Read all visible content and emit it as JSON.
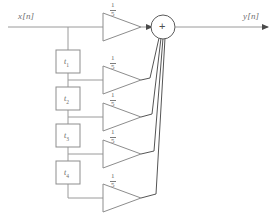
{
  "diagram": {
    "input_label": "x[n]",
    "output_label": "y[n]",
    "summer_symbol": "+",
    "line_color": "#9a9a9a",
    "shape_color": "#8d8d8d",
    "text_color": "#6f6f6f",
    "background": "#ffffff"
  },
  "delays": [
    {
      "base": "t",
      "sub": "1"
    },
    {
      "base": "t",
      "sub": "2"
    },
    {
      "base": "t",
      "sub": "3"
    },
    {
      "base": "t",
      "sub": "4"
    }
  ],
  "gains": [
    {
      "numerator": "1",
      "denominator": "5"
    },
    {
      "numerator": "1",
      "denominator": "5"
    },
    {
      "numerator": "1",
      "denominator": "5"
    },
    {
      "numerator": "1",
      "denominator": "5"
    },
    {
      "numerator": "1",
      "denominator": "5"
    }
  ]
}
